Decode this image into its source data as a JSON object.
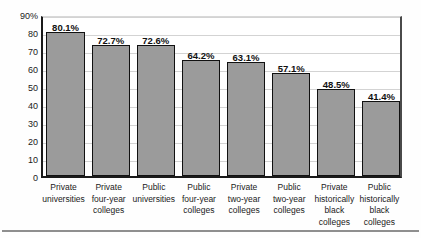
{
  "chart_data": {
    "type": "bar",
    "title": "",
    "subtitle": "",
    "xlabel": "",
    "ylabel": "",
    "ylim": [
      0,
      90
    ],
    "grid": true,
    "legend": null,
    "legend_position": "none",
    "y_tick_labels": [
      "90%",
      "80",
      "70",
      "60",
      "50",
      "40",
      "30",
      "20",
      "10",
      "0"
    ],
    "y_ticks": [
      90,
      80,
      70,
      60,
      50,
      40,
      30,
      20,
      10,
      0
    ],
    "bar_color": "#9b9b9b",
    "bar_edge_color": "#111111",
    "categories": [
      "Private universities",
      "Private four-year colleges",
      "Public universities",
      "Public four-year colleges",
      "Private two-year colleges",
      "Public two-year colleges",
      "Private historically black colleges",
      "Public historically black colleges"
    ],
    "category_lines": [
      [
        "Private",
        "universities"
      ],
      [
        "Private",
        "four-year",
        "colleges"
      ],
      [
        "Public",
        "universities"
      ],
      [
        "Public",
        "four-year",
        "colleges"
      ],
      [
        "Private",
        "two-year",
        "colleges"
      ],
      [
        "Public",
        "two-year",
        "colleges"
      ],
      [
        "Private",
        "historically",
        "black",
        "colleges"
      ],
      [
        "Public",
        "historically",
        "black",
        "colleges"
      ]
    ],
    "values": [
      80.1,
      72.7,
      72.6,
      64.2,
      63.1,
      57.1,
      48.5,
      41.4
    ],
    "value_labels": [
      "80.1%",
      "72.7%",
      "72.6%",
      "64.2%",
      "63.1%",
      "57.1%",
      "48.5%",
      "41.4%"
    ]
  }
}
